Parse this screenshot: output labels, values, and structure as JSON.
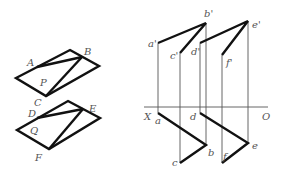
{
  "figure": {
    "left_top_shape": {
      "labels": {
        "A": "A",
        "B": "B",
        "C": "C",
        "P": "P"
      }
    },
    "left_bottom_shape": {
      "labels": {
        "D": "D",
        "E": "E",
        "F": "F",
        "Q": "Q"
      }
    },
    "projection": {
      "axis_labels": {
        "X": "X",
        "O": "O"
      },
      "front_labels": {
        "a1": "a'",
        "b1": "b'",
        "c1": "c'",
        "d1": "d'",
        "e1": "e'",
        "f1": "f'"
      },
      "top_labels": {
        "a": "a",
        "b": "b",
        "c": "c",
        "d": "d",
        "e": "e",
        "f": "f"
      }
    },
    "colors": {
      "thick_line": "#111111",
      "thin_line": "#555555",
      "label": "#555555"
    }
  }
}
